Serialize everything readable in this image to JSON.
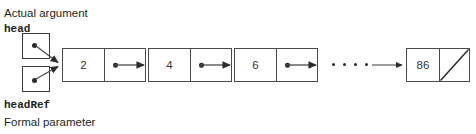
{
  "diagram": {
    "colors": {
      "background": "#ffffff",
      "stroke": "#4a4a4a",
      "text": "#231f20",
      "value_text": "#333333",
      "dot": "#2b2b2b"
    },
    "labels": {
      "actual_argument": "Actual argument",
      "head": "head",
      "head_ref": "headRef",
      "formal_parameter": "Formal parameter"
    },
    "pointer_boxes": [
      {
        "name": "head",
        "x": 22,
        "y": 33,
        "width": 28,
        "height": 26,
        "has_dot": true
      },
      {
        "name": "headRef",
        "x": 22,
        "y": 66,
        "width": 28,
        "height": 26,
        "has_dot": true
      }
    ],
    "nodes": [
      {
        "value": "2",
        "x": 62,
        "y": 48,
        "width": 84,
        "height": 34,
        "data_width": 42,
        "next": "node-4",
        "terminal": false
      },
      {
        "value": "4",
        "x": 148,
        "y": 48,
        "width": 84,
        "height": 34,
        "data_width": 42,
        "next": "node-6",
        "terminal": false
      },
      {
        "value": "6",
        "x": 234,
        "y": 48,
        "width": 84,
        "height": 34,
        "data_width": 42,
        "next": "ellipsis",
        "terminal": false
      },
      {
        "value": "86",
        "x": 406,
        "y": 48,
        "width": 64,
        "height": 34,
        "data_width": 33,
        "next": null,
        "terminal": true
      }
    ],
    "ellipsis": {
      "x": 332,
      "y": 63,
      "dot_count": 4
    },
    "arrows": [
      {
        "name": "head-to-first-node",
        "from": [
          36,
          46
        ],
        "to": [
          60,
          63
        ]
      },
      {
        "name": "headref-to-first-node",
        "from": [
          36,
          79
        ],
        "to": [
          60,
          66
        ]
      },
      {
        "name": "node2-to-node4",
        "from": [
          157,
          65
        ],
        "to": [
          146,
          65
        ]
      },
      {
        "name": "node4-to-node6",
        "from": [
          243,
          65
        ],
        "to": [
          232,
          65
        ]
      },
      {
        "name": "node6-to-ellipsis",
        "from": [
          329,
          65
        ],
        "to": [
          318,
          65
        ]
      },
      {
        "name": "ellipsis-to-last-node",
        "from": [
          368,
          65
        ],
        "to": [
          404,
          65
        ]
      }
    ]
  }
}
